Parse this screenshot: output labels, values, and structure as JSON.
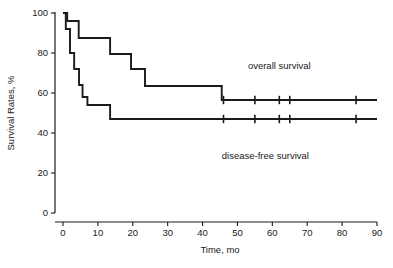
{
  "chart_data": {
    "type": "line",
    "title": "",
    "xlabel": "Time, mo",
    "ylabel": "Survival Rates, %",
    "xlim": [
      0,
      90
    ],
    "ylim": [
      0,
      100
    ],
    "xticks": [
      0,
      10,
      20,
      30,
      40,
      50,
      60,
      70,
      80,
      90
    ],
    "yticks": [
      0,
      20,
      40,
      60,
      80,
      100
    ],
    "xtick_labels": [
      "0",
      "10",
      "20",
      "30",
      "40",
      "50",
      "60",
      "70",
      "80",
      "90"
    ],
    "ytick_labels": [
      "0",
      "20",
      "40",
      "60",
      "80",
      "100"
    ],
    "grid": false,
    "legend_position": "inline-annotation",
    "line_color": "#1a1a1a",
    "background_color": "#ffffff",
    "series": [
      {
        "name": "overall survival",
        "label_x": 62,
        "label_y": 72,
        "step_points": [
          [
            0,
            100
          ],
          [
            1.2,
            100
          ],
          [
            1.2,
            96
          ],
          [
            4.5,
            96
          ],
          [
            4.5,
            87.5
          ],
          [
            13.5,
            87.5
          ],
          [
            13.5,
            79.5
          ],
          [
            19.5,
            79.5
          ],
          [
            19.5,
            72
          ],
          [
            23.5,
            72
          ],
          [
            23.5,
            63.5
          ],
          [
            45.5,
            63.5
          ],
          [
            45.5,
            56.5
          ],
          [
            90,
            56.5
          ]
        ],
        "censor_times": [
          46,
          55,
          62,
          65,
          84
        ],
        "censor_value": 56.5,
        "plateau_value": 56.5
      },
      {
        "name": "disease-free survival",
        "label_x": 58,
        "label_y": 27,
        "step_points": [
          [
            0,
            100
          ],
          [
            0.8,
            100
          ],
          [
            0.8,
            92
          ],
          [
            2.0,
            92
          ],
          [
            2.0,
            87
          ],
          [
            2.0,
            80
          ],
          [
            3.2,
            80
          ],
          [
            3.2,
            72
          ],
          [
            4.6,
            72
          ],
          [
            4.6,
            64
          ],
          [
            5.6,
            64
          ],
          [
            5.6,
            58
          ],
          [
            7.0,
            58
          ],
          [
            7.0,
            54
          ],
          [
            13.5,
            54
          ],
          [
            13.5,
            47
          ],
          [
            90,
            47
          ]
        ],
        "censor_times": [
          46,
          55,
          62,
          65,
          84
        ],
        "censor_value": 47,
        "plateau_value": 47
      }
    ]
  },
  "annotations": {
    "overall_label": "overall survival",
    "disease_free_label": "disease-free survival"
  }
}
